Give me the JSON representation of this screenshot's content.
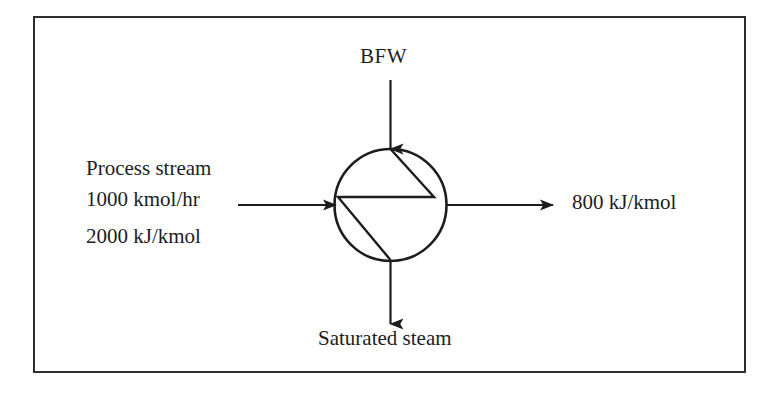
{
  "diagram": {
    "frame": {
      "stroke_color": "#2e2e2e"
    },
    "line_color": "#1d1d1d",
    "unit": {
      "name": "heat-exchanger",
      "symbol": "circle-with-zigzag",
      "center_x": 390,
      "center_y": 205,
      "radius": 56
    },
    "streams": {
      "top_inlet": {
        "label": "BFW",
        "direction": "down-into-unit"
      },
      "left_inlet": {
        "label_name": "Process stream",
        "label_flow": "1000 kmol/hr",
        "label_enthalpy": "2000 kJ/kmol",
        "direction": "right-into-unit"
      },
      "right_outlet": {
        "label": "800 kJ/kmol",
        "direction": "right-out-of-unit"
      },
      "bottom_outlet": {
        "label": "Saturated steam",
        "direction": "down-out-of-unit"
      }
    }
  }
}
